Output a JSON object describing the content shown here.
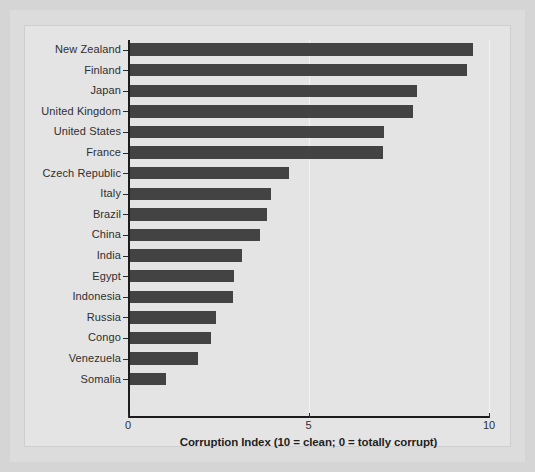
{
  "figure": {
    "background_color": "#d5d5d5",
    "mat_color": "#dcdcdc",
    "plot_background_color": "#e4e4e4",
    "bar_color": "#434343",
    "axis_color": "#1c1c1c",
    "gridline_color": "#f2f2f2"
  },
  "chart_data": {
    "type": "bar",
    "orientation": "horizontal",
    "title": "",
    "xlabel": "Corruption Index (10 = clean; 0 = totally corrupt)",
    "ylabel": "",
    "xlim": [
      0,
      10
    ],
    "xticks": [
      0,
      5,
      10
    ],
    "xtick_labels": [
      "0",
      "5",
      "10"
    ],
    "grid": true,
    "legend": false,
    "categories": [
      "New Zealand",
      "Finland",
      "Japan",
      "United Kingdom",
      "United States",
      "France",
      "Czech Republic",
      "Italy",
      "Brazil",
      "China",
      "India",
      "Egypt",
      "Indonesia",
      "Russia",
      "Congo",
      "Venezuela",
      "Somalia"
    ],
    "values": [
      9.55,
      9.4,
      8.0,
      7.9,
      7.1,
      7.05,
      4.45,
      3.95,
      3.85,
      3.65,
      3.15,
      2.95,
      2.9,
      2.45,
      2.3,
      1.95,
      1.05
    ]
  }
}
